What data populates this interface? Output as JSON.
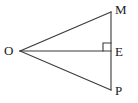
{
  "figure": {
    "type": "geometry-diagram",
    "width": 138,
    "height": 103,
    "background_color": "#ffffff",
    "stroke_color": "#3a3a3e",
    "stroke_width": 1.1,
    "label_color": "#19191c",
    "points": [
      {
        "name": "O",
        "label": "O",
        "x": 20,
        "y": 51,
        "label_x": 4,
        "label_y": 44
      },
      {
        "name": "M",
        "label": "M",
        "x": 111,
        "y": 12,
        "label_x": 115,
        "label_y": 3
      },
      {
        "name": "E",
        "label": "E",
        "x": 111,
        "y": 51,
        "label_x": 115,
        "label_y": 45
      },
      {
        "name": "P",
        "label": "P",
        "x": 111,
        "y": 90,
        "label_x": 115,
        "label_y": 84
      }
    ],
    "segments": [
      {
        "name": "OM",
        "from": "O",
        "to": "M",
        "x1": 20,
        "y1": 51,
        "x2": 111,
        "y2": 12
      },
      {
        "name": "OP",
        "from": "O",
        "to": "P",
        "x1": 20,
        "y1": 51,
        "x2": 111,
        "y2": 90
      },
      {
        "name": "OE",
        "from": "O",
        "to": "E",
        "x1": 20,
        "y1": 51,
        "x2": 111,
        "y2": 51
      },
      {
        "name": "MP",
        "from": "M",
        "to": "P",
        "x1": 111,
        "y1": 12,
        "x2": 111,
        "y2": 90
      }
    ],
    "right_angle_marker": {
      "at_point": "E",
      "quadrant": "upper-left",
      "size": 8,
      "path": "M 103 51 L 103 43 L 111 43"
    }
  }
}
